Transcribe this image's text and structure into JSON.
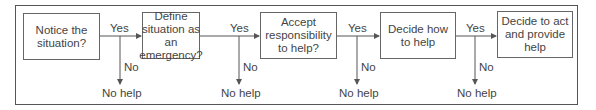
{
  "diagram": {
    "type": "flowchart",
    "steps": [
      {
        "label": "Notice the situation?"
      },
      {
        "label": "Define situation as an emergency?"
      },
      {
        "label": "Accept responsibility to help?"
      },
      {
        "label": "Decide how to help"
      },
      {
        "label": "Decide to act and provide help"
      }
    ],
    "branches": [
      {
        "yes": "Yes",
        "no": "No",
        "outcome": "No help"
      },
      {
        "yes": "Yes",
        "no": "No",
        "outcome": "No help"
      },
      {
        "yes": "Yes",
        "no": "No",
        "outcome": "No help"
      },
      {
        "yes": "Yes",
        "no": "No",
        "outcome": "No help"
      }
    ]
  }
}
